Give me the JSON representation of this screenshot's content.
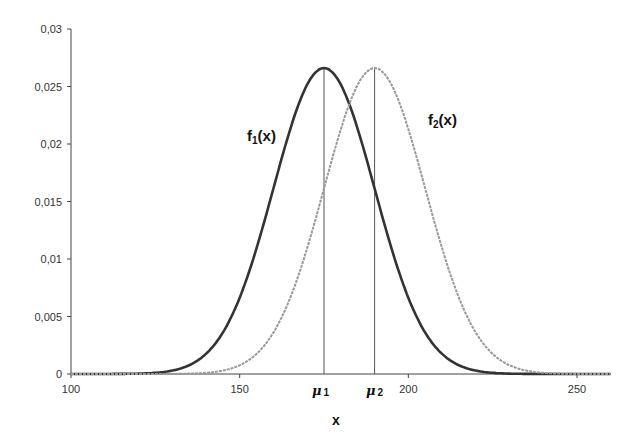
{
  "chart_data": {
    "type": "line",
    "title": "",
    "xlabel": "x",
    "ylabel": "",
    "xlim": [
      100,
      260
    ],
    "ylim": [
      0,
      0.03
    ],
    "grid": false,
    "legend": "none (curves labeled inline)",
    "x_ticks": [
      100,
      150,
      200,
      250
    ],
    "x_tick_labels": [
      "100",
      "150",
      "200",
      "250"
    ],
    "y_ticks": [
      0,
      0.005,
      0.01,
      0.015,
      0.02,
      0.025,
      0.03
    ],
    "y_tick_labels": [
      "0",
      "0,005",
      "0,01",
      "0,015",
      "0,02",
      "0,025",
      "0,03"
    ],
    "x": [
      100,
      105,
      110,
      115,
      120,
      125,
      130,
      135,
      140,
      145,
      150,
      155,
      160,
      165,
      170,
      175,
      180,
      185,
      190,
      195,
      200,
      205,
      210,
      215,
      220,
      225,
      230,
      235,
      240,
      245,
      250,
      255,
      260
    ],
    "series": [
      {
        "name": "f1(x)",
        "label": "f",
        "label_sub": "1",
        "label_suffix": "(x)",
        "mean": 175,
        "sd": 15,
        "color": "#333333",
        "values": [
          0.0,
          0.0,
          0.0,
          0.0,
          0.0001,
          0.0001,
          0.0003,
          0.0007,
          0.0017,
          0.0033,
          0.0066,
          0.0108,
          0.0161,
          0.0213,
          0.0252,
          0.0266,
          0.0252,
          0.0213,
          0.0161,
          0.0108,
          0.0066,
          0.0033,
          0.0017,
          0.0007,
          0.0003,
          0.0001,
          0.0,
          0.0,
          0.0,
          0.0,
          0.0,
          0.0,
          0.0
        ]
      },
      {
        "name": "f2(x)",
        "label": "f",
        "label_sub": "2",
        "label_suffix": "(x)",
        "mean": 190,
        "sd": 15,
        "color": "#999999",
        "values": [
          0.0,
          0.0,
          0.0,
          0.0,
          0.0,
          0.0,
          0.0,
          0.0001,
          0.0001,
          0.0003,
          0.0007,
          0.0017,
          0.0033,
          0.0066,
          0.0108,
          0.0161,
          0.0213,
          0.0252,
          0.0266,
          0.0252,
          0.0213,
          0.0161,
          0.0108,
          0.0066,
          0.0033,
          0.0017,
          0.0007,
          0.0003,
          0.0001,
          0.0001,
          0.0,
          0.0,
          0.0
        ]
      }
    ],
    "annotations": [
      {
        "type": "vline",
        "x": 175,
        "label": "μ",
        "sub": "1"
      },
      {
        "type": "vline",
        "x": 190,
        "label": "μ",
        "sub": "2"
      }
    ]
  }
}
